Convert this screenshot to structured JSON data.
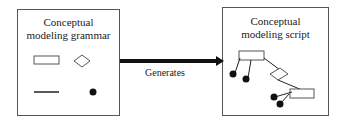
{
  "left_box": {
    "title_line1": "Conceptual",
    "title_line2": "modeling grammar",
    "symbols": [
      "rectangle-icon",
      "diamond-icon",
      "line-icon",
      "dot-icon"
    ]
  },
  "arrow": {
    "label": "Generates"
  },
  "right_box": {
    "title_line1": "Conceptual",
    "title_line2": "modeling script"
  }
}
